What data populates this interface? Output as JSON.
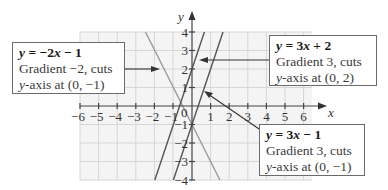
{
  "figure": {
    "axes": {
      "x_label": "x",
      "y_label": "y",
      "x_ticks": [
        "−6",
        "−5",
        "−4",
        "−3",
        "−2",
        "−1",
        "1",
        "2",
        "3",
        "4",
        "5",
        "6"
      ],
      "y_ticks": [
        "4",
        "3",
        "2",
        "1",
        "−1",
        "−2",
        "−3",
        "−4"
      ],
      "origin_label": "0",
      "x_range": [
        -6,
        6
      ],
      "y_range": [
        -4,
        4
      ]
    },
    "lines": [
      {
        "equation": "y = −2x − 1",
        "gradient": -2,
        "intercept": -1,
        "color": "#9a9a9a"
      },
      {
        "equation": "y = 3x + 2",
        "gradient": 3,
        "intercept": 2,
        "color": "#555555"
      },
      {
        "equation": "y = 3x − 1",
        "gradient": 3,
        "intercept": -1,
        "color": "#555555"
      }
    ],
    "callouts": {
      "left": {
        "eq_prefix": "y",
        "eq_rest": " = −2",
        "eq_var": "x",
        "eq_tail": " − 1",
        "line2": "Gradient −2, cuts",
        "line3_var": "y",
        "line3_rest": "-axis at (0, −1)"
      },
      "top_right": {
        "eq_prefix": "y",
        "eq_rest": " = 3",
        "eq_var": "x",
        "eq_tail": " + 2",
        "line2": "Gradient 3, cuts",
        "line3_var": "y",
        "line3_rest": "-axis at (0, 2)"
      },
      "bottom_right": {
        "eq_prefix": "y",
        "eq_rest": " = 3",
        "eq_var": "x",
        "eq_tail": " − 1",
        "line2": "Gradient 3, cuts",
        "line3_var": "y",
        "line3_rest": "-axis at (0, −1)"
      }
    },
    "colors": {
      "grid_bg": "#f4f4f4",
      "grid_line": "#d6d6d6",
      "axis": "#444444",
      "box_border": "#6b6b6b"
    }
  }
}
